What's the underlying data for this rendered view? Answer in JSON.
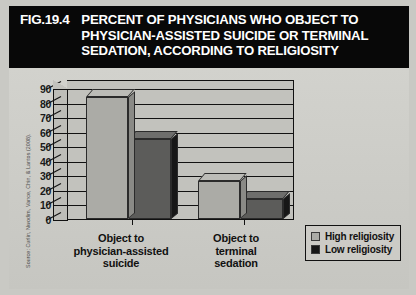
{
  "header": {
    "fig_number": "FIG.19.4",
    "title_lines": [
      "PERCENT OF PHYSICIANS WHO OBJECT TO",
      "PHYSICIAN-ASSISTED SUICIDE OR TERMINAL",
      "SEDATION, ACCORDING TO RELIGIOSITY"
    ]
  },
  "source_note": "Source: Curlin, Nwodim, Vance, Chin, & Lantos (2008).",
  "legend": {
    "items": [
      {
        "label": "High religiosity",
        "color": "#ababa6",
        "swatch_name": "legend-swatch-high-religiosity"
      },
      {
        "label": "Low religiosity",
        "color": "#171717",
        "swatch_name": "legend-swatch-low-religiosity"
      }
    ]
  },
  "axis": {
    "y_ticks": [
      "0",
      "10",
      "20",
      "30",
      "40",
      "50",
      "60",
      "70",
      "80",
      "90"
    ]
  },
  "categories_display": [
    [
      "Object to",
      "physician-assisted",
      "suicide"
    ],
    [
      "Object to",
      "terminal",
      "sedation"
    ]
  ],
  "chart_data": {
    "type": "bar",
    "title": "PERCENT OF PHYSICIANS WHO OBJECT TO PHYSICIAN-ASSISTED SUICIDE OR TERMINAL SEDATION, ACCORDING TO RELIGIOSITY",
    "xlabel": "",
    "ylabel": "",
    "ylim": [
      0,
      90
    ],
    "ytick_step": 10,
    "grid": true,
    "legend_position": "bottom-right",
    "three_d": true,
    "categories": [
      "Object to physician-assisted suicide",
      "Object to terminal sedation"
    ],
    "series": [
      {
        "name": "High religiosity",
        "color": "#ababa6",
        "values": [
          84,
          26
        ]
      },
      {
        "name": "Low religiosity",
        "color": "#5c5c5a",
        "values": [
          55,
          14
        ]
      }
    ]
  }
}
